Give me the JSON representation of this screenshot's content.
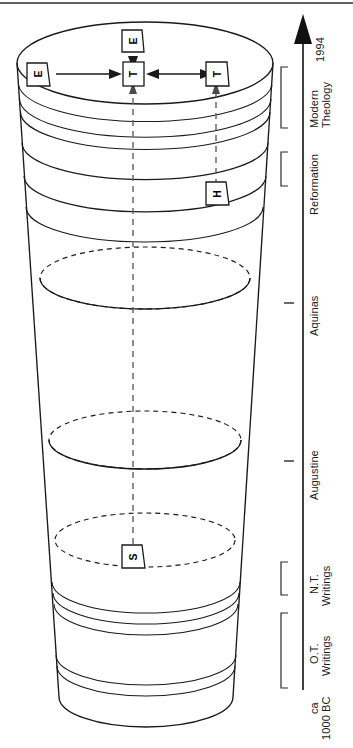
{
  "figure": {
    "orientation": "rotated-90",
    "background_color": "#ffffff",
    "line_color": "#1a1a1a"
  },
  "timeline": {
    "axis_label_top": "1994",
    "axis_label_bottom_line1": "ca",
    "axis_label_bottom_line2": "1000 BC",
    "arrow_direction": "up",
    "periods": [
      {
        "label_line1": "Modern",
        "label_line2": "Theology",
        "marker": "bracket"
      },
      {
        "label_line1": "Reformation",
        "label_line2": "",
        "marker": "bracket"
      },
      {
        "label_line1": "Aquinas",
        "label_line2": "",
        "marker": "tick"
      },
      {
        "label_line1": "Augustine",
        "label_line2": "",
        "marker": "tick"
      },
      {
        "label_line1": "N.T.",
        "label_line2": "Writings",
        "marker": "bracket"
      },
      {
        "label_line1": "O.T.",
        "label_line2": "Writings",
        "marker": "bracket"
      }
    ]
  },
  "nodes": {
    "top_e": "E",
    "left_e": "E",
    "center_t": "T",
    "right_t": "T",
    "mid_h": "H",
    "lower_s": "S"
  },
  "colors": {
    "ink": "#1a1a1a",
    "dashed_riser": "#6a6a6a",
    "paper": "#ffffff"
  }
}
